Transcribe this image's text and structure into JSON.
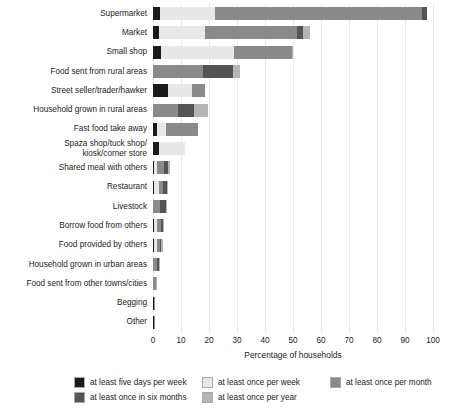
{
  "chart_data": {
    "type": "bar",
    "orientation": "horizontal",
    "stacked": true,
    "title": "",
    "xlabel": "Percentage of households",
    "ylabel": "",
    "xlim": [
      0,
      100
    ],
    "xticks": [
      0,
      10,
      20,
      30,
      40,
      50,
      60,
      70,
      80,
      90,
      100
    ],
    "grid": true,
    "grid_axis": "x",
    "legend_position": "bottom",
    "categories": [
      "Supermarket",
      "Market",
      "Small shop",
      "Food sent from rural areas",
      "Street seller/trader/hawker",
      "Household grown in rural areas",
      "Fast food take away",
      "Spaza shop/tuck shop/\nkiosk/corner store",
      "Shared meal with others",
      "Restaurant",
      "Livestock",
      "Borrow food from others",
      "Food provided by others",
      "Household grown in urban areas",
      "Food sent from other towns/cities",
      "Begging",
      "Other"
    ],
    "series": [
      {
        "name": "at least five days per week",
        "color": "#1a1a1a",
        "values": [
          2.5,
          2.0,
          3.0,
          0.0,
          5.5,
          0.0,
          1.5,
          2.0,
          0.5,
          0.5,
          0.0,
          0.5,
          0.5,
          0.0,
          0.0,
          0.3,
          0.3
        ]
      },
      {
        "name": "at least once per week",
        "color": "#e8e8e8",
        "values": [
          19.5,
          16.5,
          26.0,
          0.0,
          8.5,
          0.0,
          3.0,
          9.5,
          1.0,
          1.5,
          0.0,
          1.0,
          1.0,
          0.0,
          0.0,
          0.0,
          0.0
        ]
      },
      {
        "name": "at least once per month",
        "color": "#8a8a8a",
        "values": [
          74.0,
          33.0,
          20.5,
          18.0,
          4.5,
          9.0,
          11.5,
          0.0,
          2.5,
          1.5,
          2.5,
          1.5,
          1.0,
          1.5,
          1.2,
          0.5,
          0.5
        ]
      },
      {
        "name": "at least once in six months",
        "color": "#545454",
        "values": [
          2.0,
          2.0,
          0.0,
          10.5,
          0.0,
          5.5,
          0.0,
          0.0,
          1.5,
          1.5,
          2.0,
          0.5,
          0.5,
          0.5,
          0.0,
          0.0,
          0.0
        ]
      },
      {
        "name": "at least once per year",
        "color": "#b5b5b5",
        "values": [
          0.0,
          2.5,
          0.5,
          2.5,
          0.0,
          5.0,
          0.0,
          0.0,
          0.5,
          0.5,
          0.5,
          0.5,
          0.5,
          0.5,
          0.3,
          0.0,
          0.0
        ]
      }
    ],
    "totals": [
      98.0,
      56.0,
      50.0,
      31.0,
      18.5,
      19.5,
      16.0,
      11.5,
      6.0,
      5.5,
      5.0,
      4.0,
      3.5,
      2.5,
      1.5,
      0.8,
      0.8
    ]
  }
}
